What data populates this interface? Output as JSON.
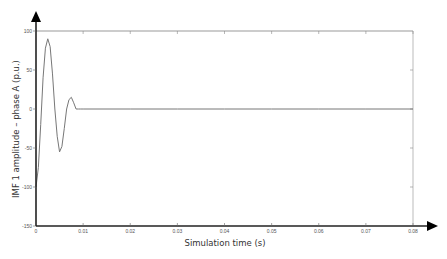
{
  "chart_data": {
    "type": "line",
    "title": "",
    "xlabel": "Simulation time (s)",
    "ylabel": "IMF 1 amplitude – phase A (p.u.)",
    "xlim": [
      0,
      0.08
    ],
    "ylim": [
      -150,
      100
    ],
    "grid": false,
    "legend": null,
    "x_ticks": [
      "0",
      "0.01",
      "0.02",
      "0.03",
      "0.04",
      "0.05",
      "0.06",
      "0.07",
      "0.08"
    ],
    "y_ticks": [
      "100",
      "50",
      "0",
      "-50",
      "-100",
      "-150"
    ],
    "series": [
      {
        "name": "IMF 1 phase A",
        "color": "#777777",
        "x": [
          0,
          0.0005,
          0.001,
          0.0015,
          0.002,
          0.0025,
          0.003,
          0.0035,
          0.004,
          0.0045,
          0.005,
          0.0055,
          0.006,
          0.0065,
          0.007,
          0.0075,
          0.008,
          0.0085,
          0.009,
          0.0095,
          0.01,
          0.02,
          0.03,
          0.04,
          0.05,
          0.06,
          0.07,
          0.08
        ],
        "values": [
          -100,
          -75,
          -20,
          40,
          78,
          90,
          80,
          45,
          0,
          -35,
          -55,
          -48,
          -25,
          0,
          12,
          15,
          8,
          0,
          0,
          0,
          0,
          0,
          0,
          0,
          0,
          0,
          0,
          0
        ]
      }
    ]
  },
  "labels": {
    "xlabel": "Simulation time (s)",
    "ylabel": "IMF 1 amplitude – phase A (p.u.)",
    "x_ticks": [
      "0",
      "0.01",
      "0.02",
      "0.03",
      "0.04",
      "0.05",
      "0.06",
      "0.07",
      "0.08"
    ],
    "y_ticks": [
      "100",
      "50",
      "0",
      "-50",
      "-100",
      "-150"
    ]
  }
}
